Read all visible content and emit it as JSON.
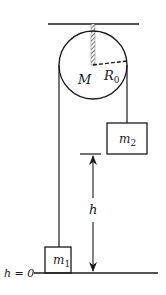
{
  "diagram": {
    "type": "atwood-machine-pulley",
    "labels": {
      "pulley_mass": "M",
      "pulley_radius": "R",
      "pulley_radius_sub": "0",
      "mass_right": "m",
      "mass_right_sub": "2",
      "mass_left": "m",
      "mass_left_sub": "1",
      "height": "h",
      "ground": "h = 0"
    },
    "colors": {
      "stroke": "#1a1a1a",
      "background": "#ffffff",
      "hatch": "#555555"
    }
  }
}
